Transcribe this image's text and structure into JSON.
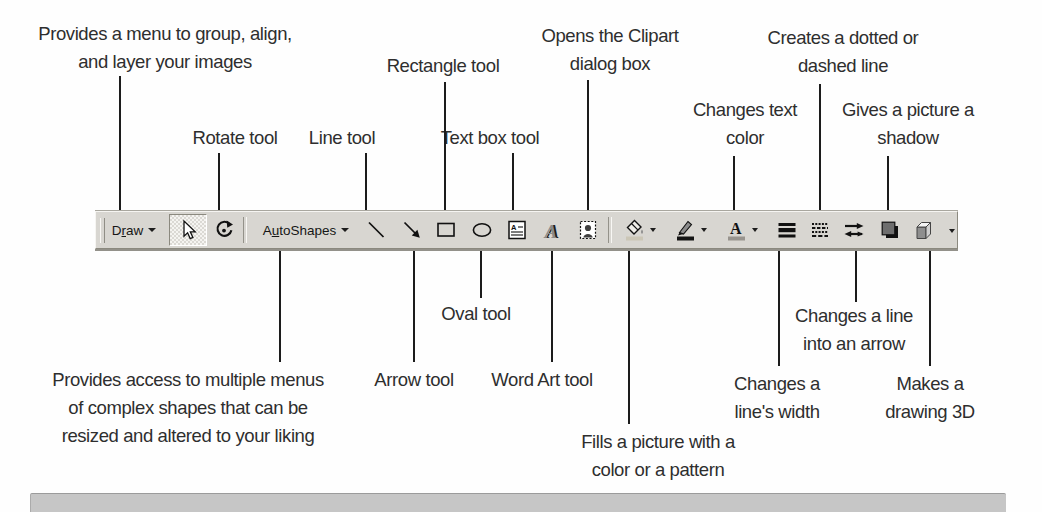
{
  "colors": {
    "page_bg": "#fefefe",
    "toolbar_bg": "#d8d6d1",
    "leader_line": "#1c1c1c",
    "label_text": "#2e2e2e",
    "bottom_bar_bg": "#c6c6c6",
    "fill_color_swatch": "#cbc6b6",
    "line_color_swatch": "#141414",
    "font_color_swatch": "#98948e"
  },
  "toolbar": {
    "draw_button": {
      "label": "Draw",
      "parts": [
        "D",
        "r",
        "aw"
      ]
    },
    "autoshapes_button": {
      "label": "AutoShapes",
      "parts": [
        "A",
        "u",
        "toShapes"
      ]
    },
    "tools": [
      "draw-menu",
      "select-objects",
      "free-rotate",
      "autoshapes-menu",
      "line",
      "arrow",
      "rectangle",
      "oval",
      "text-box",
      "word-art",
      "clip-art",
      "fill-color",
      "line-color",
      "font-color",
      "line-style",
      "dash-style",
      "arrow-style",
      "shadow",
      "3d",
      "more-buttons"
    ]
  },
  "callouts": {
    "top": [
      {
        "id": "draw-menu",
        "lines": [
          "Provides a menu to group, align,",
          "and layer your images"
        ]
      },
      {
        "id": "rotate",
        "lines": [
          "Rotate tool"
        ]
      },
      {
        "id": "line",
        "lines": [
          "Line tool"
        ]
      },
      {
        "id": "rectangle",
        "lines": [
          "Rectangle tool"
        ]
      },
      {
        "id": "text-box",
        "lines": [
          "Text box tool"
        ]
      },
      {
        "id": "clipart",
        "lines": [
          "Opens the Clipart",
          "dialog box"
        ]
      },
      {
        "id": "text-color",
        "lines": [
          "Changes text",
          "color"
        ]
      },
      {
        "id": "dash-style",
        "lines": [
          "Creates a dotted or",
          "dashed line"
        ]
      },
      {
        "id": "shadow",
        "lines": [
          "Gives a picture a",
          "shadow"
        ]
      }
    ],
    "bottom": [
      {
        "id": "autoshapes",
        "lines": [
          "Provides access to multiple menus",
          "of complex shapes that can be",
          "resized and altered to your liking"
        ]
      },
      {
        "id": "arrow",
        "lines": [
          "Arrow tool"
        ]
      },
      {
        "id": "oval",
        "lines": [
          "Oval tool"
        ]
      },
      {
        "id": "word-art",
        "lines": [
          "Word Art tool"
        ]
      },
      {
        "id": "fill-color",
        "lines": [
          "Fills a picture with a",
          "color or a pattern"
        ]
      },
      {
        "id": "line-width",
        "lines": [
          "Changes a",
          "line's width"
        ]
      },
      {
        "id": "arrow-style",
        "lines": [
          "Changes a line",
          "into an arrow"
        ]
      },
      {
        "id": "make-3d",
        "lines": [
          "Makes a",
          "drawing 3D"
        ]
      }
    ]
  }
}
